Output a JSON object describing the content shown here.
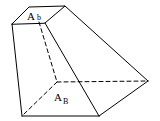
{
  "diagram": {
    "type": "frustum-like solid (truncated pyramid)",
    "labels": {
      "top_main": "A",
      "top_sub": "b",
      "bottom_main": "A",
      "bottom_sub": "B"
    },
    "colors": {
      "stroke": "#000000",
      "background": "#ffffff"
    }
  }
}
